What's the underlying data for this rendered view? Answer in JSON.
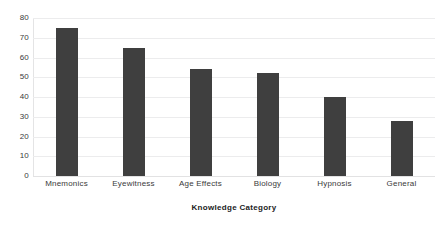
{
  "chart_data": {
    "type": "bar",
    "title": "",
    "subtitle": "",
    "xlabel": "Knowledge Category",
    "ylabel": "",
    "categories": [
      "Mnemonics",
      "Eyewitness",
      "Age Effects",
      "Biology",
      "Hypnosis",
      "General"
    ],
    "values": [
      75,
      65,
      54,
      52,
      40,
      28
    ],
    "ylim": [
      0,
      80
    ],
    "y_ticks": [
      0,
      10,
      20,
      30,
      40,
      50,
      60,
      70,
      80
    ],
    "y_tick_labels": [
      "0",
      "10",
      "20",
      "30",
      "40",
      "50",
      "60",
      "70",
      "80"
    ],
    "grid": true,
    "grid_axis": "y",
    "legend": false,
    "legend_position": "none",
    "bar_color": "#3f3f3f",
    "grid_color": "#ececed",
    "background_color": "#ffffff",
    "text_color": "#3a3a3a"
  }
}
